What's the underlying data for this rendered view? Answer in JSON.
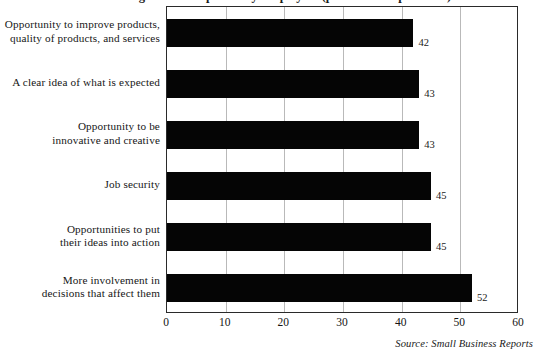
{
  "figure": {
    "title_partial": "Motivating Factors Reported by Employees (percent of respondents)",
    "title_visible": "clipped",
    "source": "Source: Small Business Reports"
  },
  "chart_data": {
    "type": "bar",
    "orientation": "horizontal",
    "title": "Motivating Factors Reported by Employees (percent of respondents)",
    "xlabel": "",
    "ylabel": "",
    "xlim": [
      0,
      60
    ],
    "xticks": [
      0,
      10,
      20,
      30,
      40,
      50,
      60
    ],
    "xtick_labels": [
      "0",
      "10",
      "20",
      "30",
      "40",
      "50",
      "60"
    ],
    "grid": true,
    "grid_axis": "x",
    "legend": false,
    "bar_color": "#050505",
    "categories": [
      "Opportunity to improve products, quality of products, and services",
      "A clear idea of what is expected",
      "Opportunity to be innovative and creative",
      "Job security",
      "Opportunities to put their ideas into action",
      "More involvement in decisions that affect them"
    ],
    "values": [
      42,
      43,
      43,
      45,
      45,
      52
    ],
    "data_labels": [
      "42",
      "43",
      "43",
      "45",
      "45",
      "52"
    ],
    "source": "Source: Small Business Reports"
  },
  "categories": [
    {
      "lines": [
        "Opportunity to improve products,",
        "quality of products, and services"
      ],
      "value": 42,
      "value_label": "42"
    },
    {
      "lines": [
        "A clear idea of what is expected"
      ],
      "value": 43,
      "value_label": "43"
    },
    {
      "lines": [
        "Opportunity to be",
        "innovative and creative"
      ],
      "value": 43,
      "value_label": "43"
    },
    {
      "lines": [
        "Job security"
      ],
      "value": 45,
      "value_label": "45"
    },
    {
      "lines": [
        "Opportunities to put",
        "their ideas into action"
      ],
      "value": 45,
      "value_label": "45"
    },
    {
      "lines": [
        "More involvement in",
        "decisions that affect them"
      ],
      "value": 52,
      "value_label": "52"
    }
  ],
  "axis": {
    "ticks": [
      {
        "label": "0",
        "value": 0
      },
      {
        "label": "10",
        "value": 10
      },
      {
        "label": "20",
        "value": 20
      },
      {
        "label": "30",
        "value": 30
      },
      {
        "label": "40",
        "value": 40
      },
      {
        "label": "50",
        "value": 50
      },
      {
        "label": "60",
        "value": 60
      }
    ]
  },
  "colors": {
    "bar": "#050505",
    "grid": "#b9b9b9",
    "frame": "#2a2a2a",
    "text": "#161616",
    "background": "#ffffff"
  }
}
